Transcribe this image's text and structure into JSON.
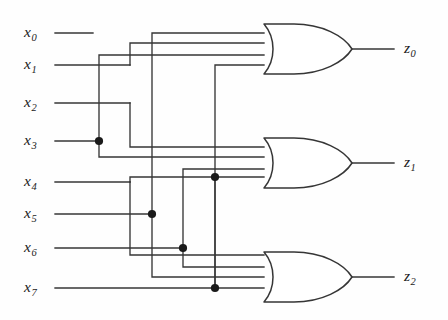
{
  "figure": {
    "kind": "logic-circuit-diagram",
    "background_color": "#fefefe",
    "wire_color": "#363636",
    "label_color": "#1b1b1b"
  },
  "inputs": [
    {
      "id": "x0",
      "name": "x",
      "index": "0",
      "y": 33
    },
    {
      "id": "x1",
      "name": "x",
      "index": "1",
      "y": 65
    },
    {
      "id": "x2",
      "name": "x",
      "index": "2",
      "y": 103
    },
    {
      "id": "x3",
      "name": "x",
      "index": "3",
      "y": 141
    },
    {
      "id": "x4",
      "name": "x",
      "index": "4",
      "y": 182
    },
    {
      "id": "x5",
      "name": "x",
      "index": "5",
      "y": 214
    },
    {
      "id": "x6",
      "name": "x",
      "index": "6",
      "y": 248
    },
    {
      "id": "x7",
      "name": "x",
      "index": "7",
      "y": 288
    }
  ],
  "outputs": [
    {
      "id": "z0",
      "name": "z",
      "index": "0",
      "y": 49
    },
    {
      "id": "z1",
      "name": "z",
      "index": "1",
      "y": 163
    },
    {
      "id": "z2",
      "name": "z",
      "index": "2",
      "y": 277
    }
  ],
  "gates": [
    {
      "id": "or-gate-z0",
      "type": "OR",
      "inputs": 4,
      "output": "z0"
    },
    {
      "id": "or-gate-z1",
      "type": "OR",
      "inputs": 4,
      "output": "z1"
    },
    {
      "id": "or-gate-z2",
      "type": "OR",
      "inputs": 4,
      "output": "z2"
    }
  ],
  "junctions": [
    {
      "id": "dot-x3",
      "x": 99,
      "y": 141
    },
    {
      "id": "dot-x5",
      "x": 152,
      "y": 214
    },
    {
      "id": "dot-x6",
      "x": 183,
      "y": 248
    },
    {
      "id": "dot-x7",
      "x": 215,
      "y": 288
    },
    {
      "id": "dot-x4-bus",
      "x": 215,
      "y": 177
    }
  ]
}
